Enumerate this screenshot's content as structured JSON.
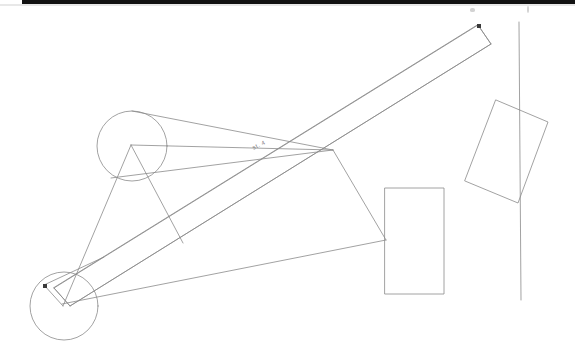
{
  "figure": {
    "background_color": "#ffffff",
    "stroke_color": "#8a8a8a",
    "dark_mark_color": "#3a3a3a",
    "scan_band_color": "#121212",
    "width": 575,
    "height": 362
  },
  "annotations": {
    "beam_label": "st. 4",
    "beam_label_x": 252,
    "beam_label_y": 142
  },
  "chart_data": {
    "type": "diagram",
    "xlabel": "",
    "ylabel": "",
    "xlim": [
      0,
      575
    ],
    "ylim": [
      0,
      362
    ],
    "grid": false,
    "legend": "none",
    "stroke_color": "#8a8a8a",
    "stroke_width": 0.8,
    "circles": [
      {
        "name": "upper-circle",
        "cx": 132,
        "cy": 146,
        "r": 35
      },
      {
        "name": "lower-circle",
        "cx": 64,
        "cy": 306,
        "r": 34
      }
    ],
    "rectangles": [
      {
        "name": "upright-rectangle",
        "points": [
          [
            385,
            188
          ],
          [
            444,
            188
          ],
          [
            444,
            294
          ],
          [
            385,
            294
          ]
        ]
      },
      {
        "name": "tilted-rectangle",
        "points": [
          [
            496,
            100
          ],
          [
            548,
            122
          ],
          [
            518,
            203
          ],
          [
            465,
            181
          ]
        ]
      }
    ],
    "polygons": [
      {
        "name": "long-beam",
        "points": [
          [
            478,
            25
          ],
          [
            491,
            44
          ],
          [
            70,
            306
          ],
          [
            54,
            288
          ]
        ]
      }
    ],
    "lines": [
      {
        "name": "vertical-line",
        "x1": 519,
        "y1": 22,
        "x2": 521,
        "y2": 300
      },
      {
        "name": "beam-top-edge",
        "x1": 478,
        "y1": 25,
        "x2": 54,
        "y2": 288
      },
      {
        "name": "beam-bottom-edge",
        "x1": 491,
        "y1": 44,
        "x2": 70,
        "y2": 306
      },
      {
        "name": "beam-tip-cap",
        "x1": 478,
        "y1": 25,
        "x2": 491,
        "y2": 44
      },
      {
        "name": "beam-base-cap",
        "x1": 54,
        "y1": 288,
        "x2": 70,
        "y2": 306
      },
      {
        "name": "upper-circle-to-vertex",
        "x1": 132,
        "y1": 111,
        "x2": 333,
        "y2": 150
      },
      {
        "name": "vertex-to-upper-apex",
        "x1": 333,
        "y1": 150,
        "x2": 131,
        "y2": 145
      },
      {
        "name": "upper-apex-left-leg",
        "x1": 131,
        "y1": 145,
        "x2": 63,
        "y2": 306
      },
      {
        "name": "upper-apex-right-leg",
        "x1": 131,
        "y1": 145,
        "x2": 183,
        "y2": 243
      },
      {
        "name": "mid-chord-left",
        "x1": 111,
        "y1": 178,
        "x2": 333,
        "y2": 150
      },
      {
        "name": "vertex-to-rect-left",
        "x1": 333,
        "y1": 150,
        "x2": 386,
        "y2": 240
      },
      {
        "name": "lower-horizontal-tie",
        "x1": 62,
        "y1": 304,
        "x2": 386,
        "y2": 240
      },
      {
        "name": "lower-circle-chord",
        "x1": 44,
        "y1": 285,
        "x2": 63,
        "y2": 306
      },
      {
        "name": "lower-circle-chord-up",
        "x1": 44,
        "y1": 285,
        "x2": 104,
        "y2": 257
      }
    ],
    "markers": [
      {
        "name": "beam-tip-marker",
        "x": 479,
        "y": 26
      },
      {
        "name": "lower-pivot-marker",
        "x": 45,
        "y": 286
      }
    ],
    "text_annotations": [
      {
        "name": "beam-label",
        "text": "st. 4",
        "x": 252,
        "y": 142,
        "rotation": -26
      }
    ]
  }
}
